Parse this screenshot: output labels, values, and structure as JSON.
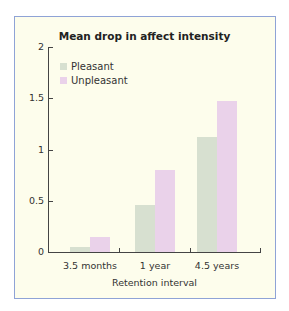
{
  "chart_data": {
    "type": "bar",
    "title": "Mean drop in affect intensity",
    "xlabel": "Retention interval",
    "ylabel": "",
    "categories": [
      "3.5 months",
      "1 year",
      "4.5 years"
    ],
    "series": [
      {
        "name": "Pleasant",
        "color": "#d7e0d0",
        "values": [
          0.05,
          0.46,
          1.12
        ]
      },
      {
        "name": "Unpleasant",
        "color": "#ead2ea",
        "values": [
          0.15,
          0.8,
          1.47
        ]
      }
    ],
    "ylim": [
      0,
      2
    ],
    "yticks": [
      "0",
      "0.5",
      "1",
      "1.5",
      "2"
    ],
    "grid": false,
    "legend_position": "upper-left"
  },
  "colors": {
    "background": "#fdfdec",
    "frame_border": "#8fa3d6",
    "pleasant": "#d7e0d0",
    "unpleasant": "#ead2ea"
  }
}
